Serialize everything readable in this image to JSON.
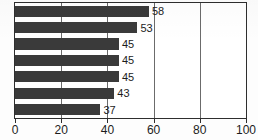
{
  "chart_data": {
    "type": "bar",
    "orientation": "horizontal",
    "title": "",
    "subtitle": "",
    "xlabel": "",
    "ylabel": "",
    "categories": [
      "",
      "",
      "",
      "",
      "",
      "",
      ""
    ],
    "values": [
      58,
      53,
      45,
      45,
      45,
      43,
      37
    ],
    "data_labels": [
      "58",
      "53",
      "45",
      "45",
      "45",
      "43",
      "37"
    ],
    "xlim": [
      0,
      100
    ],
    "xticks": [
      0,
      20,
      40,
      60,
      80,
      100
    ],
    "xtick_labels": [
      "0",
      "20",
      "40",
      "60",
      "80",
      "100"
    ],
    "gridlines": [
      20,
      40,
      60,
      80
    ],
    "grid": true,
    "legend": null,
    "legend_position": "none",
    "bar_color": "#3a3a3a",
    "axis_color": "#2e2e2e",
    "grid_color": "#6b6b6b",
    "background_color": "#ffffff"
  }
}
